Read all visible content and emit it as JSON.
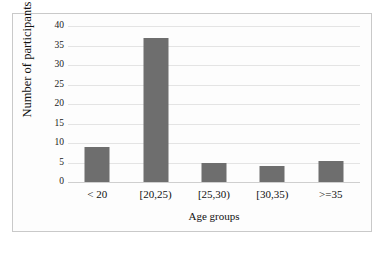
{
  "chart_data": {
    "type": "bar",
    "title": "",
    "subtitle": "",
    "xlabel": "Age groups",
    "ylabel": "Number of participants",
    "categories": [
      "< 20",
      "[20,25)",
      "[25,30)",
      "[30,35)",
      ">=35"
    ],
    "values": [
      9,
      37,
      5,
      4,
      5.5
    ],
    "ylim": [
      0,
      40
    ],
    "yticks": [
      "0",
      "5",
      "10",
      "15",
      "20",
      "25",
      "30",
      "35",
      "40"
    ],
    "ytick_values": [
      0,
      5,
      10,
      15,
      20,
      25,
      30,
      35,
      40
    ],
    "grid": true,
    "legend": false,
    "legend_position": "none",
    "bar_color": "#6e6e6e",
    "grid_color": "#e4e4e4",
    "axis_color": "#cfcfcf",
    "background_color": "#fdfdfd",
    "frame_color": "#c9c9c9"
  }
}
